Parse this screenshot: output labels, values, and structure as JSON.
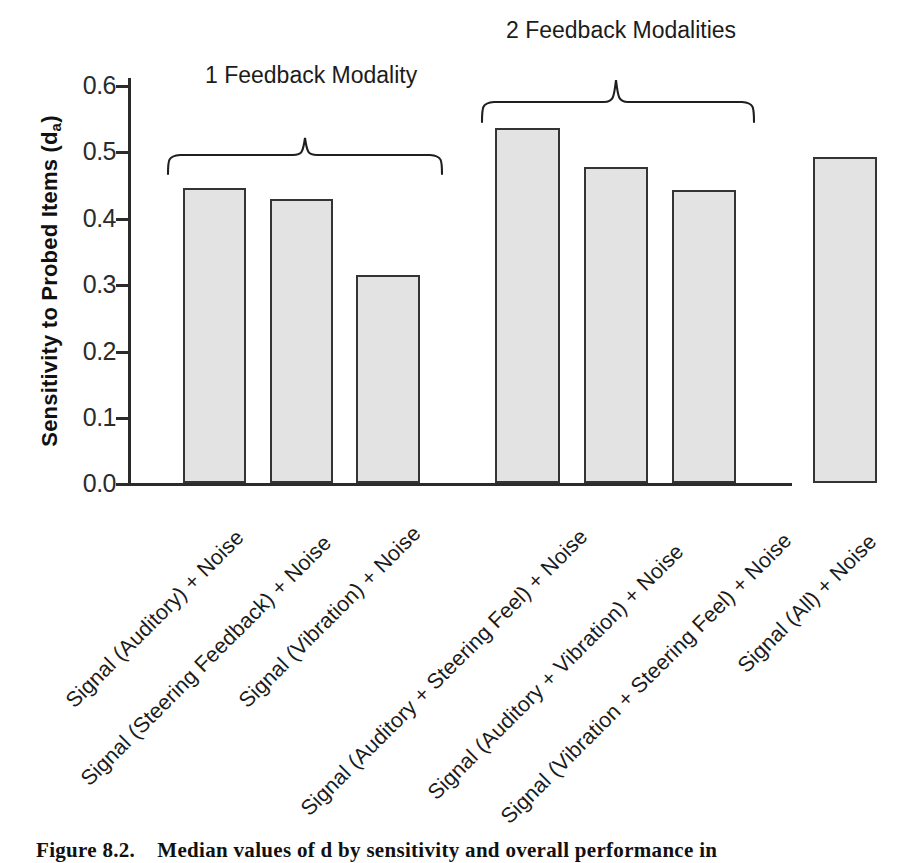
{
  "chart_data": {
    "type": "bar",
    "title": "",
    "xlabel": "",
    "ylabel": "Sensitivity to Probed Items (d",
    "ylabel_sub": "a",
    "ylabel_tail": ")",
    "ylim": [
      0.0,
      0.6
    ],
    "grid": false,
    "legend": "none",
    "y_ticks": [
      "0.0",
      "0.1",
      "0.2",
      "0.3",
      "0.4",
      "0.5",
      "0.6"
    ],
    "y_tick_values": [
      0.0,
      0.1,
      0.2,
      0.3,
      0.4,
      0.5,
      0.6
    ],
    "categories": [
      "Signal (Auditory) + Noise",
      "Signal (Steering Feedback) + Noise",
      "Signal (Vibration) + Noise",
      "Signal (Auditory + Steering Feel) + Noise",
      "Signal (Auditory + Vibration) + Noise",
      "Signal (Vibration + Steering Feel) + Noise",
      "Signal (All) + Noise"
    ],
    "values": [
      0.445,
      0.428,
      0.313,
      0.535,
      0.477,
      0.442,
      0.492
    ],
    "bar_fill_color": "#e3e3e3",
    "bar_edge_color": "#343434",
    "annotations": [
      {
        "text": "1 Feedback Modality",
        "covers": [
          0,
          1,
          2
        ]
      },
      {
        "text": "2 Feedback Modalities",
        "covers": [
          3,
          4,
          5
        ]
      }
    ]
  },
  "figure": {
    "caption_label": "Figure 8.2.",
    "caption_text": "Median values of d  by sensitivity and overall performance in"
  }
}
